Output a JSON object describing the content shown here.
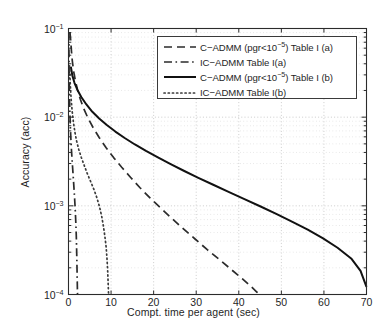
{
  "chart_data": {
    "type": "line",
    "title": "",
    "xlabel": "Compt. time per agent (sec)",
    "ylabel": "Accuracy (acc)",
    "xscale": "linear",
    "yscale": "log",
    "xlim": [
      0,
      70
    ],
    "ylim": [
      0.0001,
      0.1
    ],
    "grid": true,
    "grid_style": "dotted",
    "legend_position": "top-right",
    "xticks": [
      0,
      10,
      20,
      30,
      40,
      50,
      60,
      70
    ],
    "xtick_labels": [
      "0",
      "10",
      "20",
      "30",
      "40",
      "50",
      "60",
      "70"
    ],
    "yticks": [
      0.1,
      0.01,
      0.001,
      0.0001
    ],
    "ytick_labels": [
      "10-1",
      "10-2",
      "10-3",
      "10-4"
    ],
    "ytick_mantissa": [
      "10",
      "10",
      "10",
      "10"
    ],
    "ytick_exponent": [
      "−1",
      "−2",
      "−3",
      "−4"
    ],
    "series": [
      {
        "name": "C−ADMM (pgr<10−5) Table I (a)",
        "name_prefix": "C−ADMM (pgr<10",
        "name_exponent": "−5",
        "name_suffix": ") Table I (a)",
        "style": "dashed",
        "color": "#2b2b2b",
        "width": 1.7,
        "points": [
          [
            0.35,
            0.09
          ],
          [
            0.5,
            0.075
          ],
          [
            0.7,
            0.055
          ],
          [
            0.9,
            0.043
          ],
          [
            1.2,
            0.033
          ],
          [
            1.6,
            0.026
          ],
          [
            2.1,
            0.0205
          ],
          [
            2.8,
            0.0158
          ],
          [
            3.6,
            0.0124
          ],
          [
            4.6,
            0.0097
          ],
          [
            5.8,
            0.0076
          ],
          [
            7.2,
            0.0059
          ],
          [
            8.8,
            0.00455
          ],
          [
            10.6,
            0.0035
          ],
          [
            12.5,
            0.00272
          ],
          [
            14.6,
            0.00209
          ],
          [
            16.8,
            0.0016
          ],
          [
            19.2,
            0.00122
          ],
          [
            21.7,
            0.00094
          ],
          [
            24.3,
            0.00072
          ],
          [
            27.0,
            0.00055
          ],
          [
            29.8,
            0.00042
          ],
          [
            32.6,
            0.00032
          ],
          [
            35.4,
            0.000249
          ],
          [
            38.2,
            0.000192
          ],
          [
            40.8,
            0.000151
          ],
          [
            42.8,
            0.000124
          ],
          [
            44.3,
            0.000106
          ],
          [
            44.9,
            0.0001
          ]
        ]
      },
      {
        "name": "IC−ADMM Table I(a)",
        "style": "dashdot",
        "color": "#2b2b2b",
        "width": 1.7,
        "points": [
          [
            0.08,
            0.09
          ],
          [
            0.1,
            0.06
          ],
          [
            0.13,
            0.04
          ],
          [
            0.17,
            0.026
          ],
          [
            0.23,
            0.017
          ],
          [
            0.32,
            0.0115
          ],
          [
            0.42,
            0.0081
          ],
          [
            0.55,
            0.0058
          ],
          [
            0.7,
            0.0042
          ],
          [
            0.88,
            0.0031
          ],
          [
            1.05,
            0.00235
          ],
          [
            1.22,
            0.00178
          ],
          [
            1.38,
            0.00135
          ],
          [
            1.52,
            0.00103
          ],
          [
            1.64,
            0.00079
          ],
          [
            1.74,
            0.00061
          ],
          [
            1.83,
            0.00046
          ],
          [
            1.9,
            0.00034
          ],
          [
            1.96,
            0.00025
          ],
          [
            2.01,
            0.000185
          ],
          [
            2.06,
            0.000138
          ],
          [
            2.1,
            0.000108
          ],
          [
            2.12,
            0.0001
          ]
        ]
      },
      {
        "name": "C−ADMM (pgr<10−5) Table I (b)",
        "name_prefix": "C−ADMM (pgr<10",
        "name_exponent": "−5",
        "name_suffix": ") Table I (b)",
        "style": "solid",
        "color": "#111111",
        "width": 2.0,
        "points": [
          [
            0.55,
            0.037
          ],
          [
            0.9,
            0.0295
          ],
          [
            1.4,
            0.0244
          ],
          [
            2.1,
            0.0203
          ],
          [
            3.0,
            0.0169
          ],
          [
            4.2,
            0.0139
          ],
          [
            5.6,
            0.0115
          ],
          [
            7.2,
            0.00965
          ],
          [
            9.0,
            0.00815
          ],
          [
            11.0,
            0.00688
          ],
          [
            13.2,
            0.00582
          ],
          [
            15.6,
            0.00492
          ],
          [
            18.2,
            0.00416
          ],
          [
            21.0,
            0.00351
          ],
          [
            24.0,
            0.00295
          ],
          [
            27.2,
            0.00247
          ],
          [
            30.5,
            0.00207
          ],
          [
            34.0,
            0.00173
          ],
          [
            37.6,
            0.00144
          ],
          [
            41.2,
            0.0012
          ],
          [
            45.0,
            0.00099
          ],
          [
            48.8,
            0.00081
          ],
          [
            52.6,
            0.00066
          ],
          [
            56.2,
            0.00054
          ],
          [
            59.8,
            0.00043
          ],
          [
            63.2,
            0.000337
          ],
          [
            66.4,
            0.000255
          ],
          [
            68.6,
            0.000185
          ],
          [
            70.0,
            0.000122
          ]
        ]
      },
      {
        "name": "IC−ADMM Table I(b)",
        "style": "dotted",
        "color": "#3a3a3a",
        "width": 1.7,
        "points": [
          [
            0.25,
            0.038
          ],
          [
            0.4,
            0.0245
          ],
          [
            0.6,
            0.0165
          ],
          [
            0.85,
            0.0118
          ],
          [
            1.15,
            0.0088
          ],
          [
            1.5,
            0.0068
          ],
          [
            1.9,
            0.0054
          ],
          [
            2.4,
            0.00435
          ],
          [
            3.0,
            0.00352
          ],
          [
            3.7,
            0.00285
          ],
          [
            4.4,
            0.00232
          ],
          [
            5.2,
            0.00188
          ],
          [
            6.0,
            0.00152
          ],
          [
            6.7,
            0.00122
          ],
          [
            7.3,
            0.00097
          ],
          [
            7.8,
            0.00076
          ],
          [
            8.2,
            0.00059
          ],
          [
            8.55,
            0.00045
          ],
          [
            8.85,
            0.00034
          ],
          [
            9.05,
            0.00025
          ],
          [
            9.2,
            0.000185
          ],
          [
            9.3,
            0.00014
          ],
          [
            9.38,
            0.00011
          ],
          [
            9.42,
            0.0001
          ]
        ]
      }
    ]
  },
  "legend": {
    "entries": [
      {
        "prefix": "C−ADMM (pgr<10",
        "exponent": "−5",
        "suffix": ") Table I (a)",
        "style": "dashed"
      },
      {
        "prefix": "IC−ADMM Table I(a)",
        "exponent": "",
        "suffix": "",
        "style": "dashdot"
      },
      {
        "prefix": "C−ADMM (pgr<10",
        "exponent": "−5",
        "suffix": ") Table I (b)",
        "style": "solid"
      },
      {
        "prefix": "IC−ADMM Table I(b)",
        "exponent": "",
        "suffix": "",
        "style": "dotted"
      }
    ]
  },
  "colors": {
    "background": "#ffffff",
    "axis": "#2b2b2b",
    "grid": "#b9b9b9",
    "text": "#1f1f1f"
  }
}
